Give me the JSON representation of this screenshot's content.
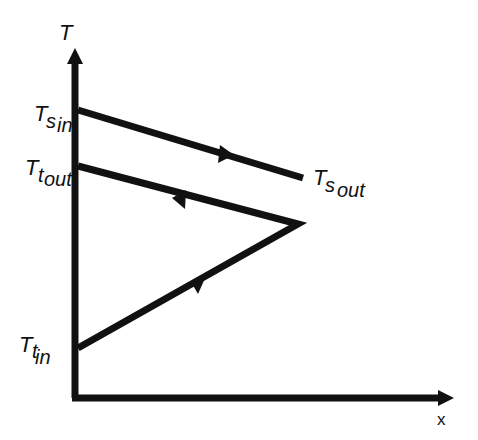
{
  "diagram": {
    "type": "temperature-profile",
    "axes": {
      "y_label": "T",
      "x_label": "x"
    },
    "labels": {
      "ts_in": {
        "main": "T",
        "sub": "s",
        "subsub": "in"
      },
      "tt_out": {
        "main": "T",
        "sub": "t",
        "subsub": "out"
      },
      "ts_out": {
        "main": "T",
        "sub": "s",
        "subsub": "out"
      },
      "tt_in": {
        "main": "T",
        "sub": "t",
        "subsub": "in"
      }
    },
    "lines": [
      {
        "name": "shell-fluid",
        "from": "Ts_in",
        "to": "Ts_out",
        "direction": "right"
      },
      {
        "name": "tube-fluid-pass-1",
        "from": "Tt_in",
        "to": "turnaround",
        "direction": "right"
      },
      {
        "name": "tube-fluid-pass-2",
        "from": "turnaround",
        "to": "Tt_out",
        "direction": "left"
      }
    ],
    "colors": {
      "stroke": "#111111",
      "background": "#ffffff"
    }
  }
}
